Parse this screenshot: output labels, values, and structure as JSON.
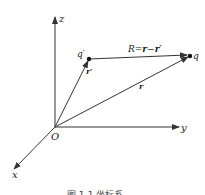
{
  "diagram": {
    "type": "vector-coordinate-diagram",
    "axes": {
      "x": "x",
      "y": "y",
      "z": "z",
      "origin": "O"
    },
    "points": {
      "source": "q′",
      "field": "q"
    },
    "vectors": {
      "source_position": "r′",
      "field_position": "r",
      "relative_label_prefix": "R",
      "relative_label_eq": "=",
      "relative_label_r": "r",
      "relative_label_minus": "−",
      "relative_label_rprime": "r′"
    },
    "caption": "图 1-1  坐标系"
  },
  "colors": {
    "line": "#333333",
    "background": "#ffffff"
  }
}
